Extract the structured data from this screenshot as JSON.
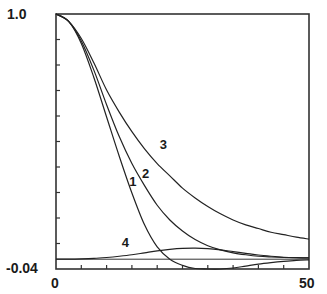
{
  "chart_data": {
    "type": "line",
    "title": "",
    "xlabel": "",
    "ylabel": "",
    "xlim": [
      0,
      50
    ],
    "ylim": [
      -0.04,
      1.0
    ],
    "x_tick_labels": [
      "0",
      "50"
    ],
    "y_tick_labels": [
      "1.0",
      "-0.04"
    ],
    "x_minor_ticks": 10,
    "y_minor_ticks": 10,
    "grid": false,
    "zero_line": true,
    "x": [
      0,
      2.5,
      5,
      7.5,
      10,
      12.5,
      15,
      17.5,
      20,
      22.5,
      25,
      27.5,
      30,
      32.5,
      35,
      37.5,
      40,
      42.5,
      45,
      47.5,
      50
    ],
    "series": [
      {
        "name": "1",
        "values": [
          1.0,
          0.97,
          0.88,
          0.74,
          0.58,
          0.42,
          0.27,
          0.14,
          0.05,
          0.0,
          -0.025,
          -0.038,
          -0.04,
          -0.04,
          -0.036,
          -0.028,
          -0.02,
          -0.014,
          -0.009,
          -0.005,
          -0.003
        ]
      },
      {
        "name": "2",
        "values": [
          1.0,
          0.97,
          0.89,
          0.77,
          0.63,
          0.5,
          0.39,
          0.3,
          0.22,
          0.16,
          0.115,
          0.08,
          0.055,
          0.038,
          0.026,
          0.018,
          0.012,
          0.009,
          0.007,
          0.006,
          0.005
        ]
      },
      {
        "name": "3",
        "values": [
          1.0,
          0.97,
          0.9,
          0.8,
          0.69,
          0.6,
          0.52,
          0.45,
          0.39,
          0.34,
          0.29,
          0.25,
          0.215,
          0.185,
          0.16,
          0.14,
          0.125,
          0.11,
          0.1,
          0.09,
          0.082
        ]
      },
      {
        "name": "4",
        "values": [
          0.0,
          0.0,
          0.001,
          0.003,
          0.007,
          0.012,
          0.018,
          0.026,
          0.034,
          0.04,
          0.044,
          0.045,
          0.043,
          0.038,
          0.031,
          0.024,
          0.017,
          0.012,
          0.008,
          0.006,
          0.005
        ]
      }
    ],
    "label_positions": {
      "1": [
        14.5,
        0.3
      ],
      "2": [
        17,
        0.33
      ],
      "3": [
        20.5,
        0.45
      ],
      "4": [
        13,
        0.05
      ]
    }
  }
}
